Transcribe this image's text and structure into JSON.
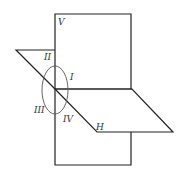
{
  "diagram": {
    "title": "",
    "labels": {
      "vertical_plane": "V",
      "horizontal_plane": "H",
      "quadrant_1": "I",
      "quadrant_2": "II",
      "quadrant_3": "III",
      "quadrant_4": "IV"
    },
    "colors": {
      "line": "#222222",
      "ellipse": "#555555",
      "background": "#ffffff"
    }
  }
}
